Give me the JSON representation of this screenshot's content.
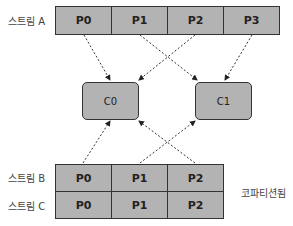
{
  "stream_a": {
    "label": "스트림 A",
    "partitions": [
      "P0",
      "P1",
      "P2",
      "P3"
    ]
  },
  "stream_b": {
    "label": "스트림 B",
    "partitions": [
      "P0",
      "P1",
      "P2"
    ]
  },
  "stream_c": {
    "label": "스트림 C",
    "partitions": [
      "P0",
      "P1",
      "P2"
    ]
  },
  "consumers": [
    "C0",
    "C1"
  ],
  "copartitioned_label": "코파티션됨",
  "colors": {
    "fill": "#b3b3b3",
    "stroke": "#333333"
  }
}
